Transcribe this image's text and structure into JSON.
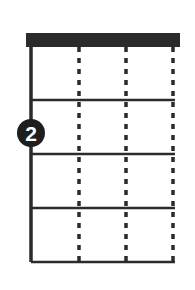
{
  "diagram": {
    "kind": "chord-fingering-diagram",
    "instrument_strings": 4,
    "frets_shown": 4,
    "background_color": "#ffffff",
    "ink_color": "#2b2b2b",
    "nut": {
      "label": "nut",
      "color": "#2b2b2b",
      "x": 26,
      "y": 33,
      "width": 154,
      "height": 14
    },
    "grid": {
      "left": 31,
      "right": 175,
      "top": 47,
      "bottom": 262,
      "string_x": [
        31,
        79,
        126,
        173
      ],
      "fret_y": [
        100,
        154,
        208,
        262
      ]
    },
    "strings": [
      {
        "name": "string-1",
        "x": 31,
        "style": "solid",
        "width": 3.5
      },
      {
        "name": "string-2",
        "x": 79,
        "style": "dotted",
        "width": 3.5
      },
      {
        "name": "string-3",
        "x": 126,
        "style": "dotted",
        "width": 3.5
      },
      {
        "name": "string-4",
        "x": 173,
        "style": "dotted",
        "width": 3.5
      }
    ],
    "frets": [
      {
        "name": "fret-line-1",
        "y": 100,
        "width": 2.6
      },
      {
        "name": "fret-line-2",
        "y": 154,
        "width": 2.6
      },
      {
        "name": "fret-line-3",
        "y": 208,
        "width": 2.6
      },
      {
        "name": "fret-line-4",
        "y": 262,
        "width": 2.6
      }
    ],
    "finger_markers": [
      {
        "name": "finger-marker-2",
        "label": "2",
        "string": 1,
        "fret": 2,
        "cx": 31,
        "cy": 133,
        "r": 14,
        "fill": "#1e1e1e",
        "text_color": "#ffffff",
        "font_size": 21
      }
    ]
  }
}
